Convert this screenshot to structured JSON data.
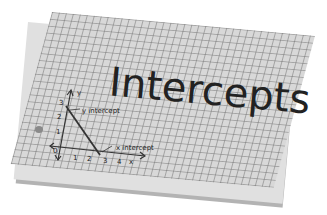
{
  "card": {
    "title": "Intercepts",
    "graph": {
      "x_axis_label": "x",
      "y_axis_label": "y",
      "origin_label": "0",
      "x_ticks": [
        "1",
        "2",
        "3",
        "4"
      ],
      "y_ticks": [
        "1",
        "2",
        "3"
      ],
      "y_intercept_label": "y intercept",
      "x_intercept_label": "x intercept",
      "line": {
        "from": [
          0,
          3
        ],
        "to": [
          3,
          0
        ]
      }
    }
  }
}
